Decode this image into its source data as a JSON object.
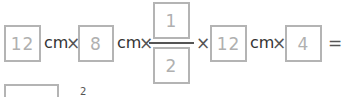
{
  "equation": {
    "terms": [
      {
        "value": "12",
        "unit": "cm",
        "operator": "×"
      },
      {
        "value": "8",
        "unit": "cm",
        "operator": "×"
      },
      {
        "fraction": {
          "numerator": "1",
          "denominator": "2"
        },
        "operator": "×"
      },
      {
        "value": "12",
        "unit": "cm",
        "operator": "×"
      },
      {
        "value": "4",
        "operator": "="
      }
    ],
    "result": {
      "value": "",
      "unit_superscript": "2"
    }
  }
}
